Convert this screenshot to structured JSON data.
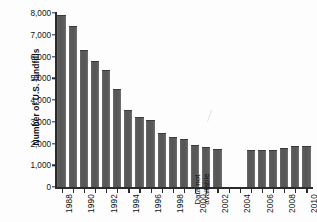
{
  "chart_data": {
    "type": "bar",
    "title": "",
    "xlabel": "",
    "ylabel": "Number of U.S. landfills",
    "ylim": [
      0,
      8000
    ],
    "ytick_labels": [
      "8,000",
      "7,000",
      "6,000",
      "5,000",
      "4,000",
      "3,000",
      "2,000",
      "1,000",
      "0"
    ],
    "ytick_values": [
      8000,
      7000,
      6000,
      5000,
      4000,
      3000,
      2000,
      1000,
      0
    ],
    "grid": false,
    "legend": "none",
    "categories": [
      "1988",
      "1989",
      "1990",
      "1991",
      "1992",
      "1993",
      "1994",
      "1995",
      "1996",
      "1997",
      "1998",
      "1999",
      "2000",
      "2001",
      "2002",
      "2003",
      "2004",
      "2005",
      "2006",
      "2007",
      "2008",
      "2009",
      "2010"
    ],
    "values": [
      7900,
      7400,
      6300,
      5800,
      5400,
      4500,
      3550,
      3200,
      3100,
      2500,
      2300,
      2200,
      1950,
      1850,
      1750,
      null,
      null,
      1720,
      1720,
      1720,
      1800,
      1890,
      1890
    ],
    "xtick_labels": [
      "1988",
      "1990",
      "1992",
      "1994",
      "1996",
      "1998",
      "2000",
      "2002",
      "2004",
      "2006",
      "2008",
      "2010"
    ],
    "annotations": [
      {
        "name": "data-not-available",
        "lines": [
          "Data not",
          "available"
        ],
        "categories": [
          "2003",
          "2004"
        ]
      }
    ],
    "bar_color": "#595959",
    "axis_color": "#2b2b2b",
    "background_color": "#fdfdfd"
  }
}
